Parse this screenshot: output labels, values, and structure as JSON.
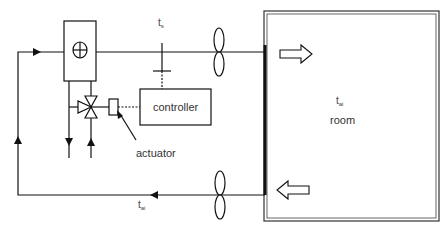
{
  "diagram": {
    "title": "",
    "type": "hvac-control-loop",
    "labels": {
      "supply_temp": {
        "base": "t",
        "sub": "s"
      },
      "return_temp": {
        "base": "t",
        "sub": "ai"
      },
      "room_temp": {
        "base": "t",
        "sub": "ai"
      },
      "room": "room",
      "controller": "controller",
      "actuator": "actuator"
    },
    "components": [
      {
        "id": "coil",
        "label": "heating/cooling coil"
      },
      {
        "id": "three-way-valve",
        "label": "three-way valve"
      },
      {
        "id": "actuator",
        "label": "actuator"
      },
      {
        "id": "controller",
        "label": "controller"
      },
      {
        "id": "supply-fan",
        "label": "supply fan"
      },
      {
        "id": "return-fan",
        "label": "return fan"
      },
      {
        "id": "supply-sensor",
        "label": "t_s"
      },
      {
        "id": "room",
        "label": "room"
      }
    ],
    "colors": {
      "line": "#111111",
      "room_border": "#555555",
      "text": "#333333"
    }
  }
}
